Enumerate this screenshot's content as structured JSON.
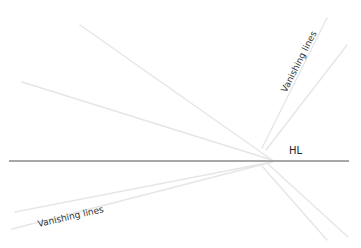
{
  "diagram": {
    "horizon": {
      "label": "HL",
      "y": 161,
      "x1": 9,
      "x2": 349,
      "color": "#8a8a8a",
      "width": 1.6
    },
    "vanishing_point": {
      "x": 275,
      "y": 161
    },
    "vanishing_lines": [
      {
        "x1": 80,
        "y1": 25,
        "x2": 272,
        "y2": 160
      },
      {
        "x1": 22,
        "y1": 82,
        "x2": 272,
        "y2": 160
      },
      {
        "x1": 327,
        "y1": 18,
        "x2": 262,
        "y2": 148
      },
      {
        "x1": 347,
        "y1": 45,
        "x2": 266,
        "y2": 150
      },
      {
        "x1": 15,
        "y1": 212,
        "x2": 272,
        "y2": 162
      },
      {
        "x1": 12,
        "y1": 229,
        "x2": 272,
        "y2": 162
      },
      {
        "x1": 262,
        "y1": 166,
        "x2": 327,
        "y2": 240
      },
      {
        "x1": 268,
        "y1": 164,
        "x2": 348,
        "y2": 237
      }
    ],
    "line_color": "#e6e6e6",
    "labels": {
      "upper": "Vanishing lines",
      "lower": "Vanishing lines"
    }
  }
}
